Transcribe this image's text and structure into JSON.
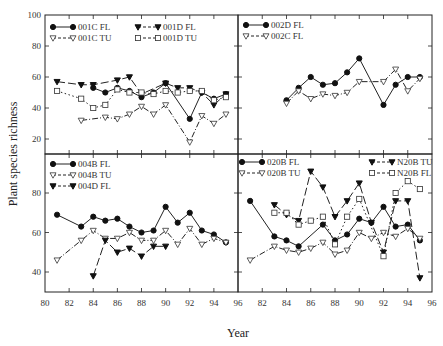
{
  "chart_data": {
    "type": "line",
    "xlabel": "Year",
    "ylabel": "Plant species richness",
    "x_tick_labels_left": [
      "80",
      "82",
      "84",
      "86",
      "88",
      "90",
      "92",
      "94",
      "96"
    ],
    "x_tick_labels_right": [
      "82",
      "84",
      "86",
      "88",
      "90",
      "92",
      "94",
      "96"
    ],
    "xlim": [
      80,
      96
    ],
    "panels": [
      {
        "id": "top-left",
        "ylim": [
          10,
          100
        ],
        "y_tick_labels": [
          "20",
          "40",
          "60",
          "80",
          "100"
        ],
        "y_ticks": [
          20,
          40,
          60,
          80,
          100
        ],
        "legend_placement": "top-left",
        "series": [
          {
            "name": "001C FL",
            "marker": "filled-circle",
            "line": "solid",
            "x": [
              84,
              85,
              86,
              87,
              88,
              89,
              90,
              92,
              93,
              94,
              95
            ],
            "y": [
              53,
              50,
              53,
              51,
              47,
              50,
              56,
              33,
              50,
              46,
              49
            ]
          },
          {
            "name": "001C TU",
            "marker": "open-triangle-down",
            "line": "dashdot",
            "x": [
              83,
              85,
              86,
              87,
              88,
              89,
              90,
              92,
              93,
              94,
              95
            ],
            "y": [
              32,
              34,
              33,
              36,
              41,
              36,
              42,
              18,
              35,
              30,
              36
            ]
          },
          {
            "name": "001D FL",
            "marker": "filled-triangle-down",
            "line": "longdash",
            "x": [
              81,
              83,
              84,
              86,
              87,
              88,
              90,
              91,
              92,
              93,
              94,
              95
            ],
            "y": [
              57,
              55,
              55,
              58,
              60,
              49,
              56,
              53,
              53,
              50,
              42,
              49
            ]
          },
          {
            "name": "001D TU",
            "marker": "open-square",
            "line": "dotted",
            "x": [
              81,
              83,
              84,
              85,
              86,
              87,
              88,
              89,
              90,
              91,
              92,
              93,
              94,
              95
            ],
            "y": [
              51,
              46,
              40,
              42,
              52,
              50,
              50,
              49,
              51,
              50,
              51,
              51,
              45,
              47
            ]
          }
        ]
      },
      {
        "id": "top-right",
        "ylim": [
          10,
          100
        ],
        "y_ticks": [
          20,
          40,
          60,
          80,
          100
        ],
        "legend_placement": "top-left",
        "series": [
          {
            "name": "002D FL",
            "marker": "filled-circle",
            "line": "solid",
            "x": [
              84,
              85,
              86,
              87,
              88,
              89,
              90,
              92,
              93,
              94,
              95
            ],
            "y": [
              45,
              53,
              60,
              55,
              56,
              63,
              72,
              42,
              55,
              60,
              60
            ]
          },
          {
            "name": "002C FL",
            "marker": "open-triangle-down",
            "line": "dashdot",
            "x": [
              84,
              85,
              86,
              87,
              88,
              89,
              90,
              92,
              93,
              94,
              95
            ],
            "y": [
              43,
              51,
              46,
              49,
              48,
              50,
              57,
              57,
              65,
              51,
              59
            ]
          }
        ]
      },
      {
        "id": "bottom-left",
        "ylim": [
          30,
          100
        ],
        "y_tick_labels": [
          "40",
          "60",
          "80"
        ],
        "y_ticks": [
          40,
          60,
          80
        ],
        "legend_placement": "top-left",
        "series": [
          {
            "name": "004B FL",
            "marker": "filled-circle",
            "line": "solid",
            "x": [
              81,
              83,
              84,
              85,
              86,
              87,
              88,
              89,
              90,
              91,
              92,
              93,
              94,
              95
            ],
            "y": [
              69,
              63,
              68,
              66,
              67,
              63,
              60,
              61,
              73,
              65,
              70,
              61,
              59,
              55
            ]
          },
          {
            "name": "004B TU",
            "marker": "open-triangle-down",
            "line": "dashdot",
            "x": [
              81,
              83,
              84,
              85,
              86,
              87,
              88,
              89,
              90,
              91,
              92,
              93,
              94,
              95
            ],
            "y": [
              46,
              56,
              61,
              57,
              57,
              60,
              56,
              56,
              61,
              54,
              62,
              54,
              57,
              55
            ]
          },
          {
            "name": "004D FL",
            "marker": "filled-triangle-down",
            "line": "longdash",
            "x": [
              84,
              85,
              86,
              87,
              88,
              89,
              90
            ],
            "y": [
              38,
              56,
              50,
              52,
              48,
              53,
              53
            ]
          }
        ]
      },
      {
        "id": "bottom-right",
        "ylim": [
          30,
          100
        ],
        "y_ticks": [
          40,
          60,
          80
        ],
        "legend_placement": "top",
        "series": [
          {
            "name": "020B FL",
            "marker": "filled-circle",
            "line": "solid",
            "x": [
              81,
              83,
              84,
              85,
              87,
              88,
              89,
              90,
              91,
              92,
              93,
              94,
              95
            ],
            "y": [
              76,
              58,
              56,
              53,
              64,
              56,
              59,
              67,
              65,
              73,
              63,
              64,
              56
            ]
          },
          {
            "name": "020B TU",
            "marker": "open-triangle-down",
            "line": "dashdot",
            "x": [
              81,
              83,
              84,
              85,
              86,
              87,
              88,
              89,
              90,
              91,
              92,
              93,
              94,
              95
            ],
            "y": [
              46,
              53,
              51,
              50,
              52,
              55,
              49,
              51,
              60,
              57,
              60,
              58,
              62,
              57
            ]
          },
          {
            "name": "N20B TU",
            "marker": "filled-triangle-down",
            "line": "longdash",
            "x": [
              83,
              84,
              85,
              86,
              87,
              88,
              89,
              90,
              91,
              92,
              93,
              94,
              95
            ],
            "y": [
              74,
              69,
              66,
              91,
              83,
              68,
              76,
              85,
              65,
              50,
              76,
              76,
              37
            ]
          },
          {
            "name": "N20B FL",
            "marker": "open-square",
            "line": "dotted",
            "x": [
              83,
              84,
              85,
              86,
              87,
              88,
              89,
              90,
              92,
              93,
              94,
              95
            ],
            "y": [
              70,
              70,
              64,
              66,
              68,
              54,
              68,
              77,
              48,
              80,
              86,
              82
            ]
          }
        ]
      }
    ]
  }
}
